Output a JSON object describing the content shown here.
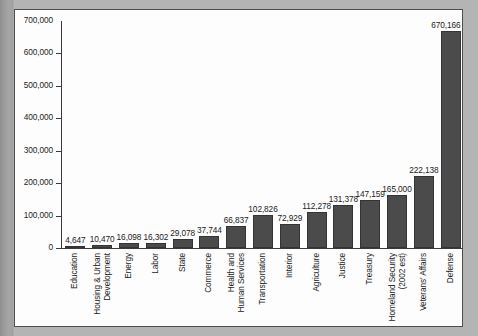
{
  "chart_data": {
    "type": "bar",
    "title": "",
    "subtitle": "",
    "xlabel": "",
    "ylabel": "",
    "ylim": [
      0,
      700000
    ],
    "ytick_labels": [
      "700,000",
      "600,000",
      "500,000",
      "400,000",
      "300,000",
      "200,000",
      "100,000",
      "0"
    ],
    "ytick_values": [
      700000,
      600000,
      500000,
      400000,
      300000,
      200000,
      100000,
      0
    ],
    "grid": false,
    "legend": "none",
    "orientation": "vertical",
    "bar_color": "#4b4b4b",
    "categories": [
      "Education",
      "Housing & Urban Development",
      "Energy",
      "Labor",
      "State",
      "Commerce",
      "Health and Human Services",
      "Transportation",
      "Interior",
      "Agriculture",
      "Justice",
      "Treasury",
      "Homeland Security (2002 est)",
      "Veterans' Affairs",
      "Defense"
    ],
    "category_lines": [
      [
        "Education"
      ],
      [
        "Housing & Urban",
        "Development"
      ],
      [
        "Energy"
      ],
      [
        "Labor"
      ],
      [
        "State"
      ],
      [
        "Commerce"
      ],
      [
        "Health and",
        "Human Services"
      ],
      [
        "Transportation"
      ],
      [
        "Interior"
      ],
      [
        "Agriculture"
      ],
      [
        "Justice"
      ],
      [
        "Treasury"
      ],
      [
        "Homeland Security",
        "(2002 est)"
      ],
      [
        "Veterans' Affairs"
      ],
      [
        "Defense"
      ]
    ],
    "values": [
      4647,
      10470,
      16098,
      16302,
      29078,
      37744,
      66837,
      102826,
      72929,
      112278,
      131378,
      147159,
      165000,
      222138,
      670166
    ],
    "value_labels": [
      "4,647",
      "10,470",
      "16,098",
      "16,302",
      "29,078",
      "37,744",
      "66,837",
      "102,826",
      "72,929",
      "112,278",
      "131,378",
      "147,159",
      "165,000",
      "222,138",
      "670,166"
    ]
  }
}
